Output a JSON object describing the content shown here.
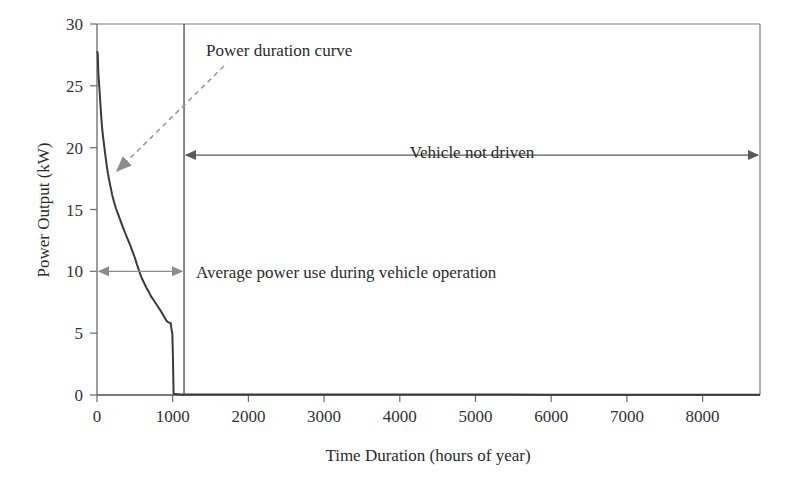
{
  "chart_data": {
    "type": "line",
    "title": "",
    "xlabel": "Time Duration (hours of year)",
    "ylabel": "Power Output (kW)",
    "xlim": [
      0,
      8760
    ],
    "ylim": [
      0,
      30
    ],
    "xticks": [
      0,
      1000,
      2000,
      3000,
      4000,
      5000,
      6000,
      7000,
      8000
    ],
    "xtick_labels": [
      "0",
      "1000",
      "2000",
      "3000",
      "4000",
      "5000",
      "6000",
      "7000",
      "8000"
    ],
    "yticks": [
      0,
      5,
      10,
      15,
      20,
      25,
      30
    ],
    "ytick_labels": [
      "0",
      "5",
      "10",
      "15",
      "20",
      "25",
      "30"
    ],
    "grid": false,
    "legend": "none",
    "series": [
      {
        "name": "Power duration curve",
        "color": "#3a3a3a",
        "points": [
          [
            0,
            27.8
          ],
          [
            10,
            27.6
          ],
          [
            18,
            26.0
          ],
          [
            25,
            25.4
          ],
          [
            34,
            24.6
          ],
          [
            44,
            23.6
          ],
          [
            55,
            22.6
          ],
          [
            66,
            21.7
          ],
          [
            78,
            21.0
          ],
          [
            92,
            20.3
          ],
          [
            108,
            19.5
          ],
          [
            125,
            18.7
          ],
          [
            142,
            18.0
          ],
          [
            160,
            17.4
          ],
          [
            180,
            16.8
          ],
          [
            200,
            16.2
          ],
          [
            225,
            15.6
          ],
          [
            250,
            15.1
          ],
          [
            280,
            14.6
          ],
          [
            310,
            14.1
          ],
          [
            340,
            13.6
          ],
          [
            372,
            13.1
          ],
          [
            405,
            12.6
          ],
          [
            440,
            12.1
          ],
          [
            470,
            11.6
          ],
          [
            500,
            11.1
          ],
          [
            525,
            10.6
          ],
          [
            548,
            10.2
          ],
          [
            570,
            9.8
          ],
          [
            595,
            9.4
          ],
          [
            620,
            9.1
          ],
          [
            650,
            8.7
          ],
          [
            680,
            8.4
          ],
          [
            712,
            8.0
          ],
          [
            745,
            7.7
          ],
          [
            778,
            7.4
          ],
          [
            810,
            7.1
          ],
          [
            842,
            6.8
          ],
          [
            872,
            6.5
          ],
          [
            898,
            6.2
          ],
          [
            918,
            6.0
          ],
          [
            935,
            5.9
          ],
          [
            955,
            5.85
          ],
          [
            975,
            5.8
          ],
          [
            985,
            5.3
          ],
          [
            995,
            5.0
          ],
          [
            1003,
            3.2
          ],
          [
            1008,
            1.4
          ],
          [
            1012,
            0.1
          ],
          [
            1100,
            0.05
          ],
          [
            2000,
            0.04
          ],
          [
            4000,
            0.04
          ],
          [
            6000,
            0.03
          ],
          [
            8760,
            0.03
          ]
        ]
      }
    ],
    "divider": {
      "name": "operation-boundary",
      "x": 1150,
      "color": "#4a4a4a"
    },
    "annotations": [
      {
        "name": "power-duration-curve-label",
        "text": "Power duration curve",
        "style": "dashed-arrow",
        "color": "#8c8c8c"
      },
      {
        "name": "vehicle-not-driven-label",
        "text": "Vehicle not driven",
        "style": "double-arrow",
        "color": "#5a5a5a",
        "span": [
          1150,
          8760
        ],
        "y": 19.4
      },
      {
        "name": "average-power-use-label",
        "text": "Average power use during vehicle operation",
        "style": "double-arrow",
        "color": "#8c8c8c",
        "span": [
          0,
          1150
        ],
        "y": 10
      }
    ]
  }
}
